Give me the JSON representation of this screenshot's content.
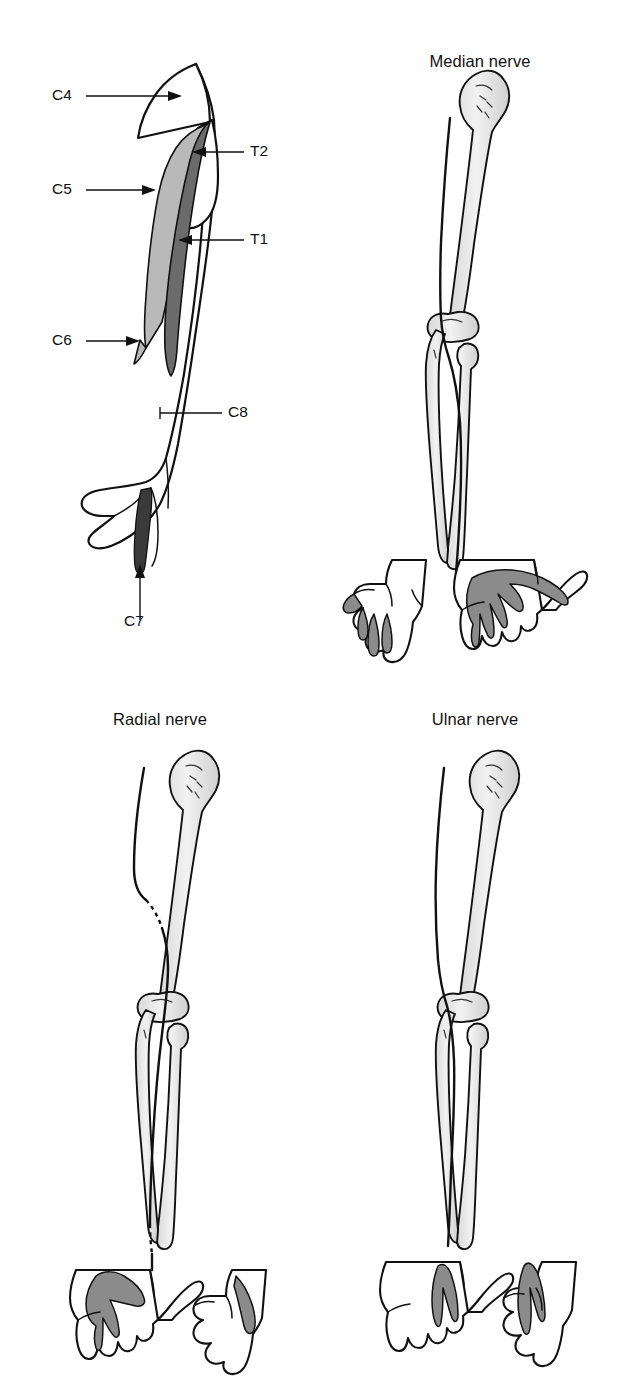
{
  "figure": {
    "kind": "anatomical-diagram",
    "background_color": "#ffffff",
    "line_color": "#111111"
  },
  "palette": {
    "dermatome_light_gray": "#b9b9b9",
    "dermatome_dark_gray": "#6b6b6b",
    "dermatome_near_black": "#3a3a3a",
    "nerve_territory_gray": "#8b8b8b",
    "bone_fill_light": "#ececec",
    "outline": "#111111",
    "white": "#ffffff"
  },
  "panels": [
    {
      "id": "dermatomes",
      "title": "",
      "position": "top-left",
      "description": "Anterior view of right upper limb showing segmental dermatome bands",
      "labels": [
        {
          "id": "c4",
          "text": "C4",
          "pointer": "arrow",
          "target": "supraclavicular / shoulder cap",
          "shade": "white"
        },
        {
          "id": "c5",
          "text": "C5",
          "pointer": "arrow",
          "target": "lateral arm band",
          "shade": "light-gray"
        },
        {
          "id": "c6",
          "text": "C6",
          "pointer": "arrow",
          "target": "lateral forearm and thumb",
          "shade": "white"
        },
        {
          "id": "c7",
          "text": "C7",
          "pointer": "arrow",
          "target": "middle finger",
          "shade": "near-black"
        },
        {
          "id": "c8",
          "text": "C8",
          "pointer": "line",
          "target": "medial forearm and little finger",
          "shade": "white"
        },
        {
          "id": "t1",
          "text": "T1",
          "pointer": "arrow",
          "target": "medial arm band",
          "shade": "dark-gray"
        },
        {
          "id": "t2",
          "text": "T2",
          "pointer": "arrow",
          "target": "axilla / medial upper arm",
          "shade": "white"
        }
      ]
    },
    {
      "id": "median-nerve",
      "title": "Median nerve",
      "position": "top-right",
      "description": "Skeleton of arm and forearm with median nerve course, plus dorsal and palmar hand territories",
      "hands": [
        {
          "view": "dorsal",
          "territory": "shaded tips of index, middle and radial half of ring finger"
        },
        {
          "view": "palmar",
          "territory": "shaded thumb, index, middle and radial half of ring finger with lateral palm"
        }
      ]
    },
    {
      "id": "radial-nerve",
      "title": "Radial nerve",
      "position": "bottom-left",
      "description": "Skeleton with radial nerve spiralling behind the humerus (dashed where hidden), plus hand territories",
      "hands": [
        {
          "view": "dorsal",
          "territory": "shaded radial dorsum, thumb and proximal index/middle dorsum"
        },
        {
          "view": "palmar",
          "territory": "small shaded strip over dorsal thumb web seen from the side"
        }
      ]
    },
    {
      "id": "ulnar-nerve",
      "title": "Ulnar nerve",
      "position": "bottom-right",
      "description": "Skeleton with ulnar nerve passing behind the medial epicondyle, plus hand territories",
      "hands": [
        {
          "view": "dorsal",
          "territory": "shaded little finger and ulnar half of ring finger"
        },
        {
          "view": "palmar",
          "territory": "shaded little finger, ulnar half of ring finger and hypothenar palm"
        }
      ]
    }
  ]
}
